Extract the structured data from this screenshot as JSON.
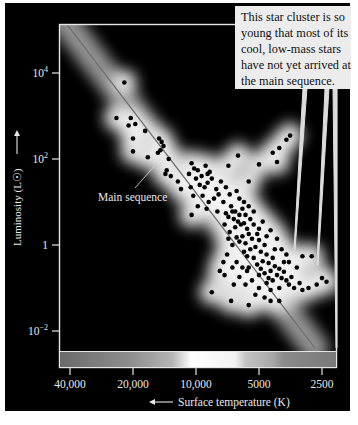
{
  "chart_data": {
    "type": "scatter",
    "title": "",
    "xlabel": "Surface temperature (K)",
    "ylabel": "Luminosity (L☉)",
    "x_scale": "log (reversed)",
    "y_scale": "log",
    "xlim": [
      44000,
      2200
    ],
    "ylim": [
      0.001,
      200000
    ],
    "x_ticks": [
      {
        "value": 40000,
        "label": "40,000"
      },
      {
        "value": 20000,
        "label": "20,000"
      },
      {
        "value": 10000,
        "label": "10,000"
      },
      {
        "value": 5000,
        "label": "5000"
      },
      {
        "value": 2500,
        "label": "2500"
      }
    ],
    "y_ticks": [
      {
        "value": 10000,
        "label": "10",
        "exp": "4"
      },
      {
        "value": 100,
        "label": "10",
        "exp": "2"
      },
      {
        "value": 1,
        "label": "1",
        "exp": ""
      },
      {
        "value": 0.01,
        "label": "10",
        "exp": "−2"
      }
    ],
    "annotations": [
      {
        "text": "Main sequence",
        "target": "main-sequence-line"
      },
      {
        "text": "This star cluster is so young that most of its cool, low-mass stars have not yet arrived at the main sequence."
      }
    ],
    "main_sequence_line": {
      "from": {
        "T": 44000,
        "L": 200000
      },
      "to": {
        "T": 2700,
        "L": 0.004
      }
    },
    "series": [
      {
        "name": "Cluster stars",
        "points": [
          {
            "T": 22000,
            "L": 6000
          },
          {
            "T": 24000,
            "L": 900
          },
          {
            "T": 20500,
            "L": 900
          },
          {
            "T": 19500,
            "L": 650
          },
          {
            "T": 21000,
            "L": 600
          },
          {
            "T": 20000,
            "L": 300
          },
          {
            "T": 17500,
            "L": 450
          },
          {
            "T": 20000,
            "L": 150
          },
          {
            "T": 17000,
            "L": 110
          },
          {
            "T": 15000,
            "L": 300
          },
          {
            "T": 14600,
            "L": 250
          },
          {
            "T": 14300,
            "L": 200
          },
          {
            "T": 14800,
            "L": 160
          },
          {
            "T": 15200,
            "L": 140
          },
          {
            "T": 13500,
            "L": 100
          },
          {
            "T": 14000,
            "L": 45
          },
          {
            "T": 13200,
            "L": 40
          },
          {
            "T": 13800,
            "L": 55
          },
          {
            "T": 12200,
            "L": 30
          },
          {
            "T": 11800,
            "L": 20
          },
          {
            "T": 10500,
            "L": 80
          },
          {
            "T": 10200,
            "L": 60
          },
          {
            "T": 9800,
            "L": 55
          },
          {
            "T": 10800,
            "L": 45
          },
          {
            "T": 9400,
            "L": 40
          },
          {
            "T": 10000,
            "L": 35
          },
          {
            "T": 9000,
            "L": 70
          },
          {
            "T": 8600,
            "L": 50
          },
          {
            "T": 8400,
            "L": 35
          },
          {
            "T": 8800,
            "L": 28
          },
          {
            "T": 9600,
            "L": 25
          },
          {
            "T": 9100,
            "L": 22
          },
          {
            "T": 10600,
            "L": 22
          },
          {
            "T": 8000,
            "L": 20
          },
          {
            "T": 7600,
            "L": 30
          },
          {
            "T": 7800,
            "L": 15
          },
          {
            "T": 8200,
            "L": 12
          },
          {
            "T": 8700,
            "L": 10
          },
          {
            "T": 9300,
            "L": 14
          },
          {
            "T": 10300,
            "L": 14
          },
          {
            "T": 7200,
            "L": 22
          },
          {
            "T": 6900,
            "L": 15
          },
          {
            "T": 7400,
            "L": 10
          },
          {
            "T": 9800,
            "L": 8
          },
          {
            "T": 8900,
            "L": 7
          },
          {
            "T": 7900,
            "L": 6
          },
          {
            "T": 10500,
            "L": 5
          },
          {
            "T": 8800,
            "L": 45
          },
          {
            "T": 7000,
            "L": 70
          },
          {
            "T": 6300,
            "L": 120
          },
          {
            "T": 5600,
            "L": 30
          },
          {
            "T": 5000,
            "L": 75
          },
          {
            "T": 4300,
            "L": 140
          },
          {
            "T": 4000,
            "L": 180
          },
          {
            "T": 4100,
            "L": 85
          },
          {
            "T": 3700,
            "L": 280
          },
          {
            "T": 3550,
            "L": 350
          },
          {
            "T": 6800,
            "L": 8
          },
          {
            "T": 6500,
            "L": 6
          },
          {
            "T": 6200,
            "L": 5
          },
          {
            "T": 6000,
            "L": 7
          },
          {
            "T": 5800,
            "L": 5
          },
          {
            "T": 6600,
            "L": 4
          },
          {
            "T": 6300,
            "L": 3.5
          },
          {
            "T": 6100,
            "L": 3
          },
          {
            "T": 5900,
            "L": 3.2
          },
          {
            "T": 6500,
            "L": 2.6
          },
          {
            "T": 5700,
            "L": 2.4
          },
          {
            "T": 5500,
            "L": 4
          },
          {
            "T": 5300,
            "L": 3
          },
          {
            "T": 5600,
            "L": 1.8
          },
          {
            "T": 6000,
            "L": 1.6
          },
          {
            "T": 6400,
            "L": 1.5
          },
          {
            "T": 6200,
            "L": 1.2
          },
          {
            "T": 5800,
            "L": 1.1
          },
          {
            "T": 5400,
            "L": 1.4
          },
          {
            "T": 5100,
            "L": 1.8
          },
          {
            "T": 5000,
            "L": 1.3
          },
          {
            "T": 5200,
            "L": 0.9
          },
          {
            "T": 5500,
            "L": 0.8
          },
          {
            "T": 5900,
            "L": 0.7
          },
          {
            "T": 5700,
            "L": 0.55
          },
          {
            "T": 5300,
            "L": 0.5
          },
          {
            "T": 4900,
            "L": 0.7
          },
          {
            "T": 4700,
            "L": 1
          },
          {
            "T": 4600,
            "L": 0.6
          },
          {
            "T": 4800,
            "L": 0.42
          },
          {
            "T": 5100,
            "L": 0.35
          },
          {
            "T": 4500,
            "L": 0.38
          },
          {
            "T": 4300,
            "L": 0.5
          },
          {
            "T": 4200,
            "L": 0.32
          },
          {
            "T": 4400,
            "L": 0.25
          },
          {
            "T": 4700,
            "L": 0.22
          },
          {
            "T": 5000,
            "L": 0.2
          },
          {
            "T": 4100,
            "L": 0.2
          },
          {
            "T": 4000,
            "L": 0.28
          },
          {
            "T": 3900,
            "L": 0.17
          },
          {
            "T": 4300,
            "L": 0.15
          },
          {
            "T": 4600,
            "L": 0.13
          },
          {
            "T": 3800,
            "L": 0.24
          },
          {
            "T": 3700,
            "L": 0.15
          },
          {
            "T": 3600,
            "L": 0.12
          },
          {
            "T": 4000,
            "L": 0.1
          },
          {
            "T": 4400,
            "L": 0.09
          },
          {
            "T": 3500,
            "L": 0.18
          },
          {
            "T": 3300,
            "L": 0.3
          },
          {
            "T": 3400,
            "L": 0.1
          },
          {
            "T": 3200,
            "L": 0.13
          },
          {
            "T": 3100,
            "L": 0.09
          },
          {
            "T": 2900,
            "L": 0.1
          },
          {
            "T": 2650,
            "L": 0.12
          },
          {
            "T": 2500,
            "L": 0.17
          },
          {
            "T": 2380,
            "L": 0.14
          },
          {
            "T": 2800,
            "L": 0.55
          },
          {
            "T": 3100,
            "L": 0.55
          },
          {
            "T": 7100,
            "L": 0.6
          },
          {
            "T": 7400,
            "L": 0.4
          },
          {
            "T": 7700,
            "L": 0.25
          },
          {
            "T": 7300,
            "L": 0.2
          },
          {
            "T": 8400,
            "L": 0.08
          },
          {
            "T": 6700,
            "L": 0.3
          },
          {
            "T": 6400,
            "L": 0.4
          },
          {
            "T": 6000,
            "L": 0.3
          },
          {
            "T": 6200,
            "L": 0.18
          },
          {
            "T": 5700,
            "L": 0.25
          },
          {
            "T": 5400,
            "L": 0.15
          },
          {
            "T": 5800,
            "L": 0.12
          },
          {
            "T": 5000,
            "L": 0.1
          },
          {
            "T": 5200,
            "L": 0.07
          },
          {
            "T": 4700,
            "L": 0.06
          },
          {
            "T": 4400,
            "L": 0.05
          },
          {
            "T": 4000,
            "L": 0.05
          },
          {
            "T": 6800,
            "L": 0.05
          },
          {
            "T": 5600,
            "L": 0.04
          },
          {
            "T": 6600,
            "L": 0.12
          },
          {
            "T": 7000,
            "L": 1.4
          },
          {
            "T": 6700,
            "L": 1
          },
          {
            "T": 6900,
            "L": 2
          },
          {
            "T": 7300,
            "L": 3
          },
          {
            "T": 7000,
            "L": 4.5
          },
          {
            "T": 6700,
            "L": 6
          },
          {
            "T": 7200,
            "L": 5.5
          },
          {
            "T": 5900,
            "L": 10
          },
          {
            "T": 6200,
            "L": 12
          },
          {
            "T": 5600,
            "L": 8
          },
          {
            "T": 6400,
            "L": 18
          },
          {
            "T": 5300,
            "L": 6
          },
          {
            "T": 4800,
            "L": 3.5
          },
          {
            "T": 4400,
            "L": 2.2
          },
          {
            "T": 4100,
            "L": 1.4
          },
          {
            "T": 3900,
            "L": 0.8
          },
          {
            "T": 3700,
            "L": 0.6
          },
          {
            "T": 3600,
            "L": 0.4
          },
          {
            "T": 4200,
            "L": 0.8
          },
          {
            "T": 4600,
            "L": 1.6
          },
          {
            "T": 5000,
            "L": 2.4
          },
          {
            "T": 5600,
            "L": 0.3
          },
          {
            "T": 4900,
            "L": 0.28
          },
          {
            "T": 4500,
            "L": 0.17
          },
          {
            "T": 3800,
            "L": 0.4
          }
        ]
      }
    ],
    "color_bar": {
      "label": "stellar color vs temperature",
      "stops": [
        {
          "T": 44000,
          "color": "#6b6b6b"
        },
        {
          "T": 20000,
          "color": "#8f8f8f"
        },
        {
          "T": 13000,
          "color": "#b5b5b5"
        },
        {
          "T": 10500,
          "color": "#ffffff"
        },
        {
          "T": 6500,
          "color": "#f2f2f2"
        },
        {
          "T": 5800,
          "color": "#c4c4c4"
        },
        {
          "T": 4300,
          "color": "#a8a8a8"
        },
        {
          "T": 3800,
          "color": "#8a8a8a"
        },
        {
          "T": 2200,
          "color": "#7a7a7a"
        }
      ]
    },
    "grid": false,
    "legend": null
  },
  "labels": {
    "main_sequence": "Main sequence",
    "callout_lines": [
      "This star cluster is so",
      "young that most of its",
      "cool, low-mass stars",
      "have not yet arrived at",
      "the main sequence."
    ],
    "x_axis_title": "Surface temperature (K)",
    "y_axis_title": "Luminosity (L☉)"
  },
  "colors": {
    "background": "#000000",
    "frame": "#e6e6e6",
    "points": "#050505",
    "line": "#6f6f6f",
    "text": "#e8e8e8",
    "callout_bg": "#ececec"
  }
}
